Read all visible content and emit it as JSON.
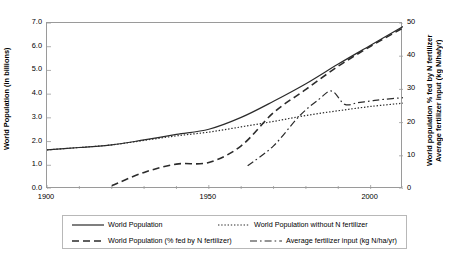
{
  "chart_data": {
    "type": "line",
    "title": "",
    "xlabel": "",
    "ylabel": "World Population (in billions)",
    "y2label": "World population % fed by N fertilizer\nAverage fertilizer input (kg N/ha/yr)",
    "xlim": [
      1900,
      2010
    ],
    "ylim": [
      0.0,
      7.0
    ],
    "y2lim": [
      0,
      50
    ],
    "grid": false,
    "legend_position": "below",
    "xticks": [
      1900,
      1950,
      2000
    ],
    "xticks_minor_step": 10,
    "yticks": [
      "0.0",
      "1.0",
      "2.0",
      "3.0",
      "4.0",
      "5.0",
      "6.0",
      "7.0"
    ],
    "y2ticks": [
      "0",
      "10",
      "20",
      "30",
      "40",
      "50"
    ],
    "series": [
      {
        "name": "World Population",
        "style": "solid",
        "axis": "left",
        "x": [
          1900,
          1910,
          1920,
          1930,
          1940,
          1950,
          1960,
          1970,
          1980,
          1990,
          2000,
          2010
        ],
        "values": [
          1.65,
          1.75,
          1.86,
          2.07,
          2.3,
          2.52,
          3.02,
          3.7,
          4.44,
          5.27,
          6.06,
          6.85
        ]
      },
      {
        "name": "World Population without N fertilizer",
        "style": "dotted",
        "axis": "left",
        "x": [
          1900,
          1910,
          1920,
          1930,
          1940,
          1950,
          1960,
          1970,
          1980,
          1990,
          2000,
          2010
        ],
        "values": [
          1.65,
          1.75,
          1.86,
          2.05,
          2.24,
          2.4,
          2.62,
          2.85,
          3.1,
          3.3,
          3.48,
          3.62
        ]
      },
      {
        "name": "World Population (% fed by N fertilizer)",
        "style": "dashed",
        "axis": "right",
        "x": [
          1920,
          1930,
          1940,
          1950,
          1960,
          1970,
          1980,
          1990,
          2000,
          2010
        ],
        "values": [
          1.0,
          5.0,
          7.5,
          8.0,
          13.0,
          23.0,
          30.0,
          37.0,
          43.0,
          48.5
        ]
      },
      {
        "name": "Average fertilizer input (kg N/ha/yr)",
        "style": "dash-dot",
        "axis": "right",
        "x": [
          1962,
          1970,
          1978,
          1984,
          1988,
          1992,
          1996,
          2000,
          2004,
          2010
        ],
        "values": [
          7.0,
          13.0,
          22.0,
          27.0,
          29.5,
          25.5,
          26.0,
          26.5,
          27.0,
          27.5
        ]
      }
    ]
  },
  "axes": {
    "left_title": "World Population (in billions)",
    "right_title": "World population % fed by N fertilizer\nAverage fertilizer input (kg N/ha/yr)"
  },
  "legend": {
    "items": [
      {
        "label": "World Population",
        "style": "solid"
      },
      {
        "label": "World Population without N fertilizer",
        "style": "dotted"
      },
      {
        "label": "World Population (% fed by N fertilizer)",
        "style": "dashed"
      },
      {
        "label": "Average fertilizer input (kg N/ha/yr)",
        "style": "dash-dot"
      }
    ]
  }
}
